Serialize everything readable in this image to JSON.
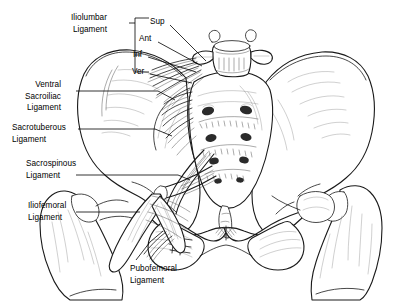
{
  "figure": {
    "view": "anterior",
    "background_color": "#ffffff",
    "line_color": "#1a1a1a",
    "leader_color": "#000000"
  },
  "labels": {
    "iliolumbar": {
      "line1": "Iliolumbar",
      "line2": "Ligament"
    },
    "ventral_sacroiliac": {
      "line1": "Ventral",
      "line2": "Sacroiliac",
      "line3": "Ligament"
    },
    "sacrotuberous": {
      "line1": "Sacrotuberous",
      "line2": "Ligament"
    },
    "sacrospinous": {
      "line1": "Sacrospinous",
      "line2": "Ligament"
    },
    "iliofemoral": {
      "line1": "Iliofemoral",
      "line2": "Ligament"
    },
    "pubofemoral": {
      "line1": "Pubofemoral",
      "line2": "Ligament"
    }
  },
  "bracket_sublabels": [
    {
      "key": "sup",
      "text": "Sup"
    },
    {
      "key": "ant",
      "text": "Ant"
    },
    {
      "key": "inf",
      "text": "Inf"
    },
    {
      "key": "ver",
      "text": "Ver"
    }
  ],
  "anatomy_parts": [
    "L5 vertebra",
    "sacrum",
    "left ilium",
    "right ilium",
    "left femur",
    "right femur",
    "pubic symphysis",
    "left obturator foramen",
    "right obturator foramen",
    "sacral foramina"
  ]
}
